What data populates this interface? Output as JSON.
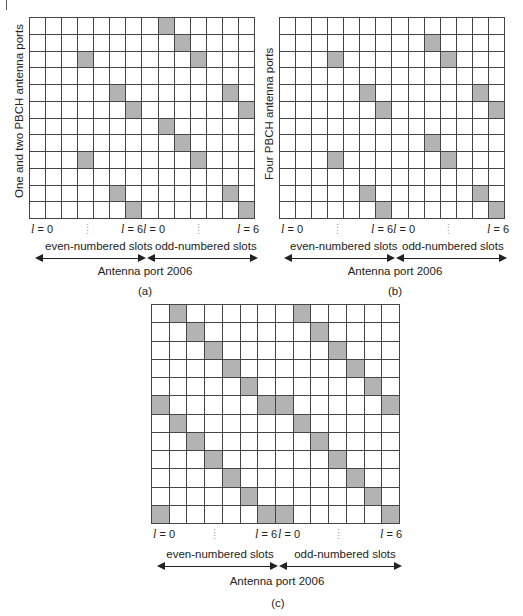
{
  "panels": [
    {
      "id": "a",
      "caption": "(a)",
      "y_label": "One and two PBCH antenna ports",
      "rows": 12,
      "cols": 14,
      "shaded_cells": [
        [
          0,
          8
        ],
        [
          1,
          9
        ],
        [
          2,
          3
        ],
        [
          2,
          10
        ],
        [
          4,
          5
        ],
        [
          4,
          12
        ],
        [
          5,
          6
        ],
        [
          5,
          13
        ],
        [
          6,
          8
        ],
        [
          7,
          9
        ],
        [
          8,
          3
        ],
        [
          8,
          10
        ],
        [
          10,
          5
        ],
        [
          10,
          12
        ],
        [
          11,
          6
        ],
        [
          11,
          13
        ]
      ],
      "ticks": {
        "l0_left": "l = 0",
        "l6_mid": "l = 6",
        "l0_mid": "l = 0",
        "l6_right": "l = 6"
      },
      "even_slots_label": "even-numbered slots",
      "odd_slots_label": "odd-numbered slots",
      "port_label": "Antenna port 2006"
    },
    {
      "id": "b",
      "caption": "(b)",
      "y_label": "Four PBCH antenna ports",
      "rows": 12,
      "cols": 14,
      "shaded_cells": [
        [
          1,
          9
        ],
        [
          2,
          3
        ],
        [
          2,
          10
        ],
        [
          4,
          5
        ],
        [
          4,
          12
        ],
        [
          5,
          6
        ],
        [
          5,
          13
        ],
        [
          7,
          9
        ],
        [
          8,
          3
        ],
        [
          8,
          10
        ],
        [
          10,
          5
        ],
        [
          10,
          12
        ],
        [
          11,
          6
        ],
        [
          11,
          13
        ]
      ],
      "ticks": {
        "l0_left": "l = 0",
        "l6_mid": "l = 6",
        "l0_mid": "l = 0",
        "l6_right": "l = 6"
      },
      "even_slots_label": "even-numbered slots",
      "odd_slots_label": "odd-numbered slots",
      "port_label": "Antenna port 2006"
    },
    {
      "id": "c",
      "caption": "(c)",
      "y_label": "",
      "rows": 12,
      "cols": 14,
      "shaded_cells": [
        [
          0,
          1
        ],
        [
          0,
          8
        ],
        [
          1,
          2
        ],
        [
          1,
          9
        ],
        [
          2,
          3
        ],
        [
          2,
          10
        ],
        [
          3,
          4
        ],
        [
          3,
          11
        ],
        [
          4,
          5
        ],
        [
          4,
          12
        ],
        [
          5,
          0
        ],
        [
          5,
          6
        ],
        [
          5,
          7
        ],
        [
          5,
          13
        ],
        [
          6,
          1
        ],
        [
          6,
          8
        ],
        [
          7,
          2
        ],
        [
          7,
          9
        ],
        [
          8,
          3
        ],
        [
          8,
          10
        ],
        [
          9,
          4
        ],
        [
          9,
          11
        ],
        [
          10,
          5
        ],
        [
          10,
          12
        ],
        [
          11,
          0
        ],
        [
          11,
          6
        ],
        [
          11,
          7
        ],
        [
          11,
          13
        ]
      ],
      "ticks": {
        "l0_left": "l = 0",
        "l6_mid": "l = 6",
        "l0_mid": "l = 0",
        "l6_right": "l = 6"
      },
      "even_slots_label": "even-numbered slots",
      "odd_slots_label": "odd-numbered slots",
      "port_label": "Antenna port 2006"
    }
  ],
  "colors": {
    "shaded": "#b3b3b3",
    "grid_line": "#444444",
    "background": "#ffffff"
  }
}
